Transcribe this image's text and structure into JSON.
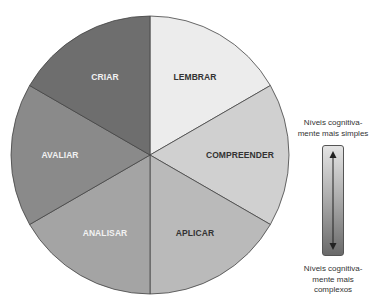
{
  "caption": "",
  "chart_data": {
    "type": "pie",
    "title": "",
    "slices": [
      {
        "label": "LEMBRAR",
        "value": 1,
        "color": "#ececec",
        "text_color": "#333333"
      },
      {
        "label": "COMPREENDER",
        "value": 1,
        "color": "#d0d0d0",
        "text_color": "#333333"
      },
      {
        "label": "APLICAR",
        "value": 1,
        "color": "#bababa",
        "text_color": "#333333"
      },
      {
        "label": "ANALISAR",
        "value": 1,
        "color": "#a4a4a4",
        "text_color": "#f2f2f2"
      },
      {
        "label": "AVALIAR",
        "value": 1,
        "color": "#8a8a8a",
        "text_color": "#f2f2f2"
      },
      {
        "label": "CRIAR",
        "value": 1,
        "color": "#6e6e6e",
        "text_color": "#f2f2f2"
      }
    ],
    "start_angle_deg": 0,
    "direction": "clockwise",
    "border_color": "#444444"
  },
  "scale": {
    "top_label_line1": "Níveis cognitiva-",
    "top_label_line2": "mente mais simples",
    "bottom_label_line1": "Níveis cognitiva-",
    "bottom_label_line2": "mente mais",
    "bottom_label_line3": "complexos",
    "gradient_top_color": "#e4e4e4",
    "gradient_bottom_color": "#6a6a6a"
  }
}
